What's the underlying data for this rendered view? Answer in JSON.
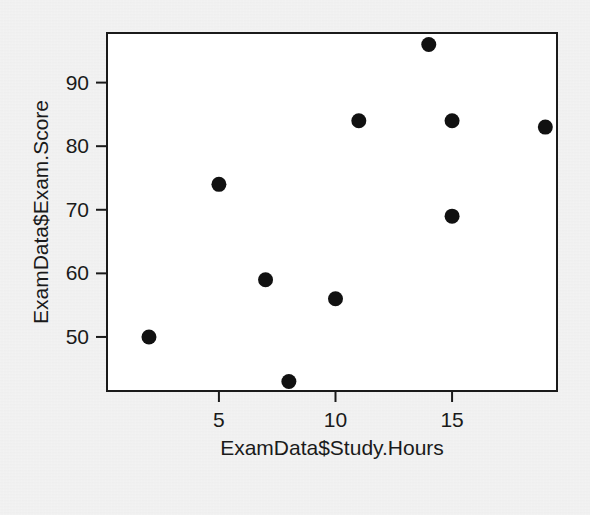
{
  "chart_data": {
    "type": "scatter",
    "title": "",
    "xlabel": "ExamData$Study.Hours",
    "ylabel": "ExamData$Exam.Score",
    "xlim": [
      0.2,
      19.5
    ],
    "ylim": [
      41.5,
      97.8
    ],
    "xticks": [
      5,
      10,
      15
    ],
    "xtick_labels": [
      "5",
      "10",
      "15"
    ],
    "yticks": [
      50,
      60,
      70,
      80,
      90
    ],
    "ytick_labels": [
      "50",
      "60",
      "70",
      "80",
      "90"
    ],
    "grid": false,
    "legend": false,
    "point_color": "#111111",
    "panel_color": "#ffffff",
    "background_color": "#e9e9e9",
    "axis_color": "#1a1a1a",
    "x": [
      2,
      5,
      7,
      8,
      10,
      11,
      14,
      15,
      15,
      19
    ],
    "y": [
      50,
      74,
      59,
      43,
      56,
      84,
      96,
      84,
      69,
      83
    ],
    "points": [
      {
        "x": 2,
        "y": 50
      },
      {
        "x": 5,
        "y": 74
      },
      {
        "x": 7,
        "y": 59
      },
      {
        "x": 8,
        "y": 43
      },
      {
        "x": 10,
        "y": 56
      },
      {
        "x": 11,
        "y": 84
      },
      {
        "x": 14,
        "y": 96
      },
      {
        "x": 15,
        "y": 84
      },
      {
        "x": 15,
        "y": 69
      },
      {
        "x": 19,
        "y": 83
      }
    ]
  },
  "plot_area": {
    "left": 107,
    "right": 557,
    "top": 33,
    "bottom": 391
  }
}
